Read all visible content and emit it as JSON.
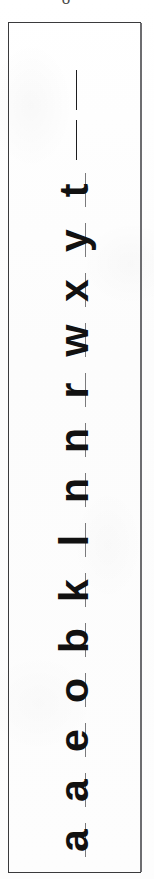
{
  "document": {
    "kind": "scanned-letter-specimen-strip",
    "orientation": "letters rotated 90 degrees counter-clockwise",
    "reading_order": "bottom of strip to top of strip",
    "top_fragment_glyph": "o",
    "box": {
      "border_color": "#3a3a3c",
      "background_color": "#fdfdfd"
    },
    "ink_color": "#111111",
    "rule_color": "#7a7a7c"
  },
  "letters": [
    {
      "char": "a",
      "rule_only": false
    },
    {
      "char": "a",
      "rule_only": false
    },
    {
      "char": "e",
      "rule_only": false
    },
    {
      "char": "o",
      "rule_only": false
    },
    {
      "char": "b",
      "rule_only": false
    },
    {
      "char": "k",
      "rule_only": false
    },
    {
      "char": "l",
      "rule_only": false
    },
    {
      "char": "n",
      "rule_only": false
    },
    {
      "char": "n",
      "rule_only": false
    },
    {
      "char": "r",
      "rule_only": false
    },
    {
      "char": "w",
      "rule_only": false
    },
    {
      "char": "x",
      "rule_only": false
    },
    {
      "char": "y",
      "rule_only": false
    },
    {
      "char": "t",
      "rule_only": false
    },
    {
      "char": "|",
      "rule_only": true
    },
    {
      "char": "|",
      "rule_only": true
    }
  ]
}
